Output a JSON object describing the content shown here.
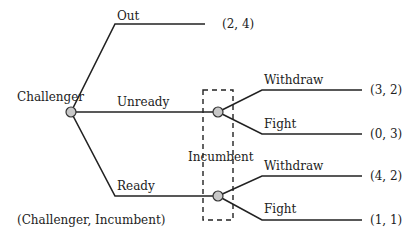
{
  "diagram": {
    "type": "extensive-form game tree",
    "legend": "(Challenger, Incumbent)",
    "players": {
      "challenger": "Challenger",
      "incumbent": "Incumbent"
    },
    "challenger_moves": {
      "out": {
        "label": "Out",
        "payoff": "(2, 4)"
      },
      "unready": {
        "label": "Unready"
      },
      "ready": {
        "label": "Ready"
      }
    },
    "incumbent_after_unready": {
      "withdraw": {
        "label": "Withdraw",
        "payoff": "(3, 2)"
      },
      "fight": {
        "label": "Fight",
        "payoff": "(0, 3)"
      }
    },
    "incumbent_after_ready": {
      "withdraw": {
        "label": "Withdraw",
        "payoff": "(4, 2)"
      },
      "fight": {
        "label": "Fight",
        "payoff": "(1, 1)"
      }
    }
  }
}
